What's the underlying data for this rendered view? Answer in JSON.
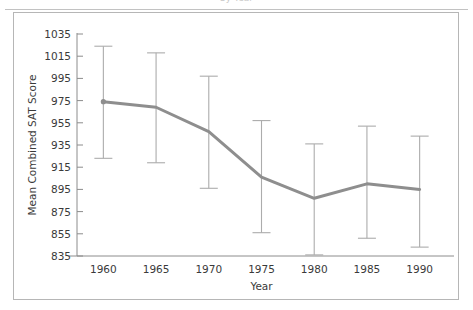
{
  "figure": {
    "top_title_fragment": "by Year",
    "frame_color": "#b6b6b6"
  },
  "chart_data": {
    "type": "line",
    "title": "",
    "xlabel": "Year",
    "ylabel": "Mean Combined SAT Score",
    "x": [
      1960,
      1965,
      1970,
      1975,
      1980,
      1985,
      1990
    ],
    "xtick_labels": [
      "1960",
      "1965",
      "1970",
      "1975",
      "1980",
      "1985",
      "1990"
    ],
    "ytick_labels": [
      "835",
      "855",
      "875",
      "895",
      "915",
      "935",
      "955",
      "975",
      "995",
      "1015",
      "1035"
    ],
    "yticks": [
      835,
      855,
      875,
      895,
      915,
      935,
      955,
      975,
      995,
      1015,
      1035
    ],
    "ylim": [
      835,
      1035
    ],
    "xlim": [
      1957.5,
      1992.5
    ],
    "grid": false,
    "legend": "none",
    "series": [
      {
        "name": "Mean Combined SAT Score",
        "values": [
          974,
          969,
          947,
          906,
          887,
          900,
          895
        ],
        "error_low": [
          923,
          919,
          896,
          856,
          836,
          851,
          843
        ],
        "error_high": [
          1024,
          1018,
          997,
          957,
          936,
          952,
          943
        ],
        "line_color": "#8e8e8e",
        "errorbar_color": "#acacac"
      }
    ]
  }
}
